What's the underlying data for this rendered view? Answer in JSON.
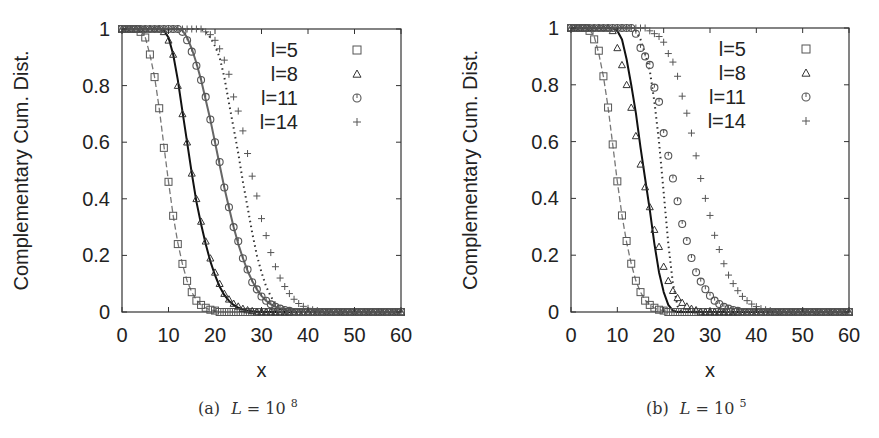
{
  "chart_data": [
    {
      "type": "line",
      "caption": {
        "prefix": "(a)",
        "var": "L",
        "eq": " = 10",
        "exp": "8"
      },
      "xlabel": "x",
      "ylabel": "Complementary Cum. Dist.",
      "xlim": [
        0,
        60
      ],
      "ylim": [
        0,
        1
      ],
      "xticks": [
        0,
        10,
        20,
        30,
        40,
        50,
        60
      ],
      "yticks": [
        0,
        0.2,
        0.4,
        0.6,
        0.8,
        1
      ],
      "ytick_labels": [
        "0",
        "0.2",
        "0.4",
        "0.6",
        "0.8",
        "1"
      ],
      "grid": false,
      "legend_position": "top-right",
      "x": [
        0,
        1,
        2,
        3,
        4,
        5,
        6,
        7,
        8,
        9,
        10,
        11,
        12,
        13,
        14,
        15,
        16,
        17,
        18,
        19,
        20,
        21,
        22,
        23,
        24,
        25,
        26,
        27,
        28,
        29,
        30,
        31,
        32,
        33,
        34,
        35,
        36,
        37,
        38,
        39,
        40,
        41,
        42,
        43,
        44,
        45,
        46,
        47,
        48,
        49,
        50,
        51,
        52,
        53,
        54,
        55,
        56,
        57,
        58,
        59,
        60
      ],
      "series": [
        {
          "name": "l=5",
          "marker": "square",
          "line": "dashed",
          "values": [
            1,
            1,
            1,
            1,
            0.99,
            0.97,
            0.91,
            0.83,
            0.72,
            0.58,
            0.46,
            0.34,
            0.24,
            0.17,
            0.11,
            0.07,
            0.04,
            0.025,
            0.015,
            0.008,
            0.005,
            0,
            0,
            0,
            0,
            0,
            0,
            0,
            0,
            0,
            0,
            0,
            0,
            0,
            0,
            0,
            0,
            0,
            0,
            0,
            0,
            0,
            0,
            0,
            0,
            0,
            0,
            0,
            0,
            0,
            0,
            0,
            0,
            0,
            0,
            0,
            0,
            0,
            0,
            0,
            0
          ],
          "fit": [
            1,
            1,
            1,
            1,
            0.995,
            0.97,
            0.91,
            0.83,
            0.72,
            0.59,
            0.46,
            0.34,
            0.245,
            0.17,
            0.11,
            0.07,
            0.042,
            0.025,
            0.014,
            0.008,
            0.004,
            0.002,
            0,
            0,
            0,
            0,
            0,
            0,
            0,
            0,
            0,
            0,
            0,
            0,
            0,
            0,
            0,
            0,
            0,
            0,
            0,
            0,
            0,
            0,
            0,
            0,
            0,
            0,
            0,
            0,
            0,
            0,
            0,
            0,
            0,
            0,
            0,
            0,
            0,
            0,
            0
          ]
        },
        {
          "name": "l=8",
          "marker": "triangle",
          "line": "solid",
          "values": [
            1,
            1,
            1,
            1,
            1,
            1,
            1,
            1,
            1,
            0.99,
            0.96,
            0.91,
            0.8,
            0.7,
            0.6,
            0.49,
            0.4,
            0.32,
            0.25,
            0.19,
            0.14,
            0.1,
            0.065,
            0.045,
            0.03,
            0.02,
            0.012,
            0.007,
            0.004,
            0,
            0,
            0,
            0,
            0,
            0,
            0,
            0,
            0,
            0,
            0,
            0,
            0,
            0,
            0,
            0,
            0,
            0,
            0,
            0,
            0,
            0,
            0,
            0,
            0,
            0,
            0,
            0,
            0,
            0,
            0,
            0
          ],
          "fit": [
            1,
            1,
            1,
            1,
            1,
            1,
            1,
            1,
            1,
            0.995,
            0.97,
            0.91,
            0.82,
            0.71,
            0.6,
            0.49,
            0.39,
            0.31,
            0.24,
            0.18,
            0.13,
            0.09,
            0.06,
            0.04,
            0.025,
            0.015,
            0.009,
            0.005,
            0.003,
            0.001,
            0,
            0,
            0,
            0,
            0,
            0,
            0,
            0,
            0,
            0,
            0,
            0,
            0,
            0,
            0,
            0,
            0,
            0,
            0,
            0,
            0,
            0,
            0,
            0,
            0,
            0,
            0,
            0,
            0,
            0,
            0
          ]
        },
        {
          "name": "l=11",
          "marker": "circle",
          "line": "solid-gray",
          "values": [
            1,
            1,
            1,
            1,
            1,
            1,
            1,
            1,
            1,
            1,
            1,
            1,
            1,
            0.99,
            0.96,
            0.92,
            0.87,
            0.82,
            0.76,
            0.68,
            0.6,
            0.53,
            0.44,
            0.37,
            0.3,
            0.25,
            0.19,
            0.15,
            0.105,
            0.08,
            0.055,
            0.04,
            0.027,
            0.018,
            0.012,
            0.007,
            0.004,
            0,
            0,
            0,
            0,
            0,
            0,
            0,
            0,
            0,
            0,
            0,
            0,
            0,
            0,
            0,
            0,
            0,
            0,
            0,
            0,
            0,
            0,
            0,
            0
          ],
          "fit": [
            1,
            1,
            1,
            1,
            1,
            1,
            1,
            1,
            1,
            1,
            1,
            1,
            1,
            0.995,
            0.97,
            0.93,
            0.88,
            0.82,
            0.75,
            0.68,
            0.6,
            0.52,
            0.44,
            0.37,
            0.3,
            0.24,
            0.19,
            0.145,
            0.11,
            0.08,
            0.057,
            0.04,
            0.027,
            0.018,
            0.011,
            0.007,
            0.004,
            0.002,
            0,
            0,
            0,
            0,
            0,
            0,
            0,
            0,
            0,
            0,
            0,
            0,
            0,
            0,
            0,
            0,
            0,
            0,
            0,
            0,
            0,
            0,
            0
          ]
        },
        {
          "name": "l=14",
          "marker": "plus",
          "line": "dotted",
          "values": [
            1,
            1,
            1,
            1,
            1,
            1,
            1,
            1,
            1,
            1,
            1,
            1,
            1,
            1,
            1,
            1,
            1,
            1,
            0.99,
            0.98,
            0.96,
            0.93,
            0.89,
            0.84,
            0.76,
            0.71,
            0.64,
            0.56,
            0.48,
            0.41,
            0.33,
            0.27,
            0.21,
            0.16,
            0.12,
            0.09,
            0.065,
            0.045,
            0.03,
            0.02,
            0.013,
            0.008,
            0.005,
            0,
            0,
            0,
            0,
            0,
            0,
            0,
            0,
            0,
            0,
            0,
            0,
            0,
            0,
            0,
            0,
            0,
            0
          ],
          "fit": [
            1,
            1,
            1,
            1,
            1,
            1,
            1,
            1,
            1,
            1,
            1,
            1,
            1,
            1,
            1,
            1,
            1,
            1,
            0.99,
            0.97,
            0.94,
            0.9,
            0.83,
            0.74,
            0.65,
            0.56,
            0.46,
            0.37,
            0.28,
            0.2,
            0.14,
            0.09,
            0.055,
            0.03,
            0.015,
            0.007,
            0.002,
            0,
            0,
            0,
            0,
            0,
            0,
            0,
            0,
            0,
            0,
            0,
            0,
            0,
            0,
            0,
            0,
            0,
            0,
            0,
            0,
            0,
            0,
            0,
            0
          ]
        }
      ]
    },
    {
      "type": "line",
      "caption": {
        "prefix": "(b)",
        "var": "L",
        "eq": " = 10",
        "exp": "5"
      },
      "xlabel": "x",
      "ylabel": "Complementary Cum. Dist.",
      "xlim": [
        0,
        60
      ],
      "ylim": [
        0,
        1
      ],
      "xticks": [
        0,
        10,
        20,
        30,
        40,
        50,
        60
      ],
      "yticks": [
        0,
        0.2,
        0.4,
        0.6,
        0.8,
        1
      ],
      "ytick_labels": [
        "0",
        "0.2",
        "0.4",
        "0.6",
        "0.8",
        "1"
      ],
      "grid": false,
      "legend_position": "top-right",
      "x": [
        0,
        1,
        2,
        3,
        4,
        5,
        6,
        7,
        8,
        9,
        10,
        11,
        12,
        13,
        14,
        15,
        16,
        17,
        18,
        19,
        20,
        21,
        22,
        23,
        24,
        25,
        26,
        27,
        28,
        29,
        30,
        31,
        32,
        33,
        34,
        35,
        36,
        37,
        38,
        39,
        40,
        41,
        42,
        43,
        44,
        45,
        46,
        47,
        48,
        49,
        50,
        51,
        52,
        53,
        54,
        55,
        56,
        57,
        58,
        59,
        60
      ],
      "series": [
        {
          "name": "l=5",
          "marker": "square",
          "line": "dashed",
          "values": [
            1,
            1,
            1,
            1,
            0.99,
            0.96,
            0.92,
            0.83,
            0.72,
            0.59,
            0.46,
            0.34,
            0.25,
            0.17,
            0.11,
            0.07,
            0.04,
            0.025,
            0.015,
            0.008,
            0.005,
            0,
            0,
            0,
            0,
            0,
            0,
            0,
            0,
            0,
            0,
            0,
            0,
            0,
            0,
            0,
            0,
            0,
            0,
            0,
            0,
            0,
            0,
            0,
            0,
            0,
            0,
            0,
            0,
            0,
            0,
            0,
            0,
            0,
            0,
            0,
            0,
            0,
            0,
            0,
            0
          ],
          "fit": [
            1,
            1,
            1,
            1,
            0.995,
            0.97,
            0.91,
            0.83,
            0.72,
            0.59,
            0.46,
            0.34,
            0.245,
            0.17,
            0.11,
            0.07,
            0.042,
            0.025,
            0.014,
            0.008,
            0.004,
            0.002,
            0,
            0,
            0,
            0,
            0,
            0,
            0,
            0,
            0,
            0,
            0,
            0,
            0,
            0,
            0,
            0,
            0,
            0,
            0,
            0,
            0,
            0,
            0,
            0,
            0,
            0,
            0,
            0,
            0,
            0,
            0,
            0,
            0,
            0,
            0,
            0,
            0,
            0,
            0
          ]
        },
        {
          "name": "l=8",
          "marker": "triangle",
          "line": "solid",
          "values": [
            1,
            1,
            1,
            1,
            1,
            1,
            1,
            1,
            1,
            0.99,
            0.93,
            0.87,
            0.8,
            0.72,
            0.62,
            0.52,
            0.44,
            0.37,
            0.29,
            0.23,
            0.16,
            0.11,
            0.075,
            0.05,
            0.033,
            0.02,
            0.012,
            0.007,
            0,
            0,
            0,
            0,
            0,
            0,
            0,
            0,
            0,
            0,
            0,
            0,
            0,
            0,
            0,
            0,
            0,
            0,
            0,
            0,
            0,
            0,
            0,
            0,
            0,
            0,
            0,
            0,
            0,
            0,
            0,
            0,
            0
          ],
          "fit": [
            1,
            1,
            1,
            1,
            1,
            1,
            1,
            1,
            1,
            1,
            0.99,
            0.96,
            0.89,
            0.8,
            0.7,
            0.58,
            0.47,
            0.36,
            0.24,
            0.14,
            0.07,
            0.025,
            0.005,
            0,
            0,
            0,
            0,
            0,
            0,
            0,
            0,
            0,
            0,
            0,
            0,
            0,
            0,
            0,
            0,
            0,
            0,
            0,
            0,
            0,
            0,
            0,
            0,
            0,
            0,
            0,
            0,
            0,
            0,
            0,
            0,
            0,
            0,
            0,
            0,
            0,
            0
          ]
        },
        {
          "name": "l=11",
          "marker": "circle",
          "line": "none",
          "values": [
            1,
            1,
            1,
            1,
            1,
            1,
            1,
            1,
            1,
            1,
            1,
            1,
            1,
            1,
            0.98,
            0.93,
            0.9,
            0.87,
            0.79,
            0.74,
            0.63,
            0.55,
            0.47,
            0.39,
            0.31,
            0.25,
            0.19,
            0.14,
            0.107,
            0.08,
            0.057,
            0.04,
            0.028,
            0.018,
            0.012,
            0.007,
            0.004,
            0,
            0,
            0,
            0,
            0,
            0,
            0,
            0,
            0,
            0,
            0,
            0,
            0,
            0,
            0,
            0,
            0,
            0,
            0,
            0,
            0,
            0,
            0,
            0
          ],
          "fit": null
        },
        {
          "name": "l=14",
          "marker": "plus",
          "line": "dotted",
          "values": [
            1,
            1,
            1,
            1,
            1,
            1,
            1,
            1,
            1,
            1,
            1,
            1,
            1,
            1,
            1,
            1,
            1,
            0.99,
            0.98,
            0.97,
            0.95,
            0.91,
            0.88,
            0.83,
            0.76,
            0.7,
            0.63,
            0.55,
            0.47,
            0.4,
            0.34,
            0.27,
            0.22,
            0.17,
            0.13,
            0.1,
            0.075,
            0.055,
            0.04,
            0.028,
            0.019,
            0.012,
            0.008,
            0.005,
            0,
            0,
            0,
            0,
            0,
            0,
            0,
            0,
            0,
            0,
            0,
            0,
            0,
            0,
            0,
            0,
            0
          ],
          "fit": [
            1,
            1,
            1,
            1,
            1,
            1,
            1,
            1,
            1,
            1,
            1,
            1,
            1,
            1,
            0.99,
            0.96,
            0.91,
            0.85,
            0.74,
            0.6,
            0.42,
            0.24,
            0.1,
            0.02,
            0,
            0,
            0,
            0,
            0,
            0,
            0,
            0,
            0,
            0,
            0,
            0,
            0,
            0,
            0,
            0,
            0,
            0,
            0,
            0,
            0,
            0,
            0,
            0,
            0,
            0,
            0,
            0,
            0,
            0,
            0,
            0,
            0,
            0,
            0,
            0,
            0
          ]
        }
      ]
    }
  ]
}
